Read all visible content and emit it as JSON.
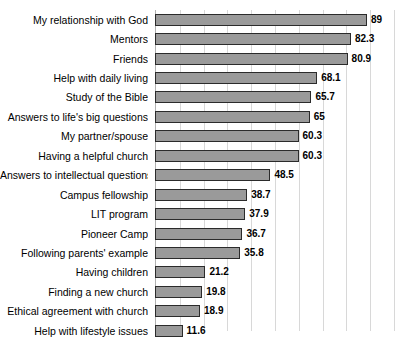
{
  "chart_data": {
    "type": "bar",
    "orientation": "horizontal",
    "title": "",
    "xlabel": "",
    "ylabel": "",
    "xlim": [
      0,
      105
    ],
    "grid": true,
    "gridline_interval": 10,
    "legend": "none",
    "bar_color": "#9a9a9a",
    "bar_border_color": "#2b2b2b",
    "gridline_color": "#d8d8d8",
    "categories": [
      "My relationship with God",
      "Mentors",
      "Friends",
      "Help with daily living",
      "Study of the Bible",
      "Answers to life's big questions",
      "My partner/spouse",
      "Having a helpful church",
      "Answers to intellectual questions",
      "Campus fellowship",
      "LIT program",
      "Pioneer Camp",
      "Following parents' example",
      "Having children",
      "Finding a new church",
      "Ethical agreement with church",
      "Help with lifestyle issues"
    ],
    "values": [
      89,
      82.3,
      80.9,
      68.1,
      65.7,
      65,
      60.3,
      60.3,
      48.5,
      38.7,
      37.9,
      36.7,
      35.8,
      21.2,
      19.8,
      18.9,
      11.6
    ],
    "value_labels": [
      "89",
      "82.3",
      "80.9",
      "68.1",
      "65.7",
      "65",
      "60.3",
      "60.3",
      "48.5",
      "38.7",
      "37.9",
      "36.7",
      "35.8",
      "21.2",
      "19.8",
      "18.9",
      "11.6"
    ]
  }
}
